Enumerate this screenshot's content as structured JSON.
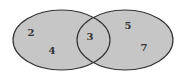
{
  "diagram": {
    "type": "venn",
    "colors": {
      "fill": "#c6c6c6",
      "stroke": "#333333",
      "background": "#ffffff",
      "text": "#333333"
    },
    "sets": [
      {
        "name": "left-set",
        "cx": 61.5,
        "cy": 40,
        "rx": 48.5,
        "ry": 30
      },
      {
        "name": "right-set",
        "cx": 125,
        "cy": 40,
        "rx": 48,
        "ry": 30
      }
    ],
    "regions": {
      "left_only": [
        "2",
        "4"
      ],
      "intersection": [
        "3"
      ],
      "right_only": [
        "5",
        "7"
      ]
    },
    "labels": [
      {
        "id": "num-2",
        "text": "2",
        "x": 31,
        "y": 36
      },
      {
        "id": "num-4",
        "text": "4",
        "x": 52,
        "y": 54
      },
      {
        "id": "num-3",
        "text": "3",
        "x": 90,
        "y": 40
      },
      {
        "id": "num-5",
        "text": "5",
        "x": 128,
        "y": 29
      },
      {
        "id": "num-7",
        "text": "7",
        "x": 144,
        "y": 51
      }
    ]
  }
}
